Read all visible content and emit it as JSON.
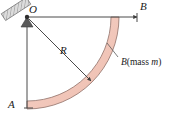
{
  "figure": {
    "background_color": "#ffffff",
    "width": 173,
    "height": 118,
    "labels": {
      "pivot": "O",
      "end_top": "B",
      "end_bottom": "A",
      "radius": "R",
      "body_symbol": "B",
      "body_mass_open": "(mass ",
      "body_mass_symbol": "m",
      "body_mass_close": ")"
    },
    "colors": {
      "rod_fill": "#f2c9bd",
      "rod_fill_light": "#f9e3db",
      "rod_edge": "#8a6a62",
      "line": "#4a4a4a",
      "support_hatch": "#9a9a9a",
      "support_fill": "#d8d8d8",
      "text": "#1a1a1a"
    },
    "geometry": {
      "pivot_x": 27,
      "pivot_y": 17,
      "radius_outer": 92,
      "radius_inner": 84,
      "arc_start_deg": 0,
      "arc_end_deg": 90,
      "point_B_x": 138,
      "point_B_y": 17,
      "point_A_x": 27,
      "point_A_y": 108,
      "radius_arrow_tip_x": 92,
      "radius_arrow_tip_y": 82,
      "leader_start_x": 119,
      "leader_start_y": 58,
      "leader_end_x": 108,
      "leader_end_y": 44
    }
  }
}
